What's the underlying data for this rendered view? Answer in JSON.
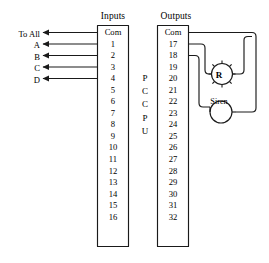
{
  "diagram": {
    "title_inputs": "Inputs",
    "title_outputs": "Outputs",
    "controller_label": "PCCPU",
    "controller_chars": [
      "P",
      "C",
      "C",
      "P",
      "U"
    ],
    "stroke_color": "#1a1a1a",
    "background_color": "#ffffff"
  },
  "inputs_block": {
    "header": "Inputs",
    "terminals": [
      "Com",
      "1",
      "2",
      "3",
      "4",
      "5",
      "6",
      "7",
      "8",
      "9",
      "10",
      "11",
      "12",
      "13",
      "14",
      "15",
      "16"
    ]
  },
  "outputs_block": {
    "header": "Outputs",
    "terminals": [
      "Com",
      "17",
      "18",
      "19",
      "20",
      "21",
      "22",
      "23",
      "24",
      "25",
      "26",
      "27",
      "28",
      "29",
      "30",
      "31",
      "32"
    ]
  },
  "input_wires": [
    {
      "label": "To All",
      "terminal": "Com"
    },
    {
      "label": "A",
      "terminal": "1"
    },
    {
      "label": "B",
      "terminal": "2"
    },
    {
      "label": "C",
      "terminal": "3"
    },
    {
      "label": "D",
      "terminal": "4"
    }
  ],
  "output_devices": [
    {
      "label": "R",
      "type": "strobe-bell",
      "terminal": "17"
    },
    {
      "label": "Siren",
      "type": "siren",
      "terminal": "18"
    }
  ]
}
